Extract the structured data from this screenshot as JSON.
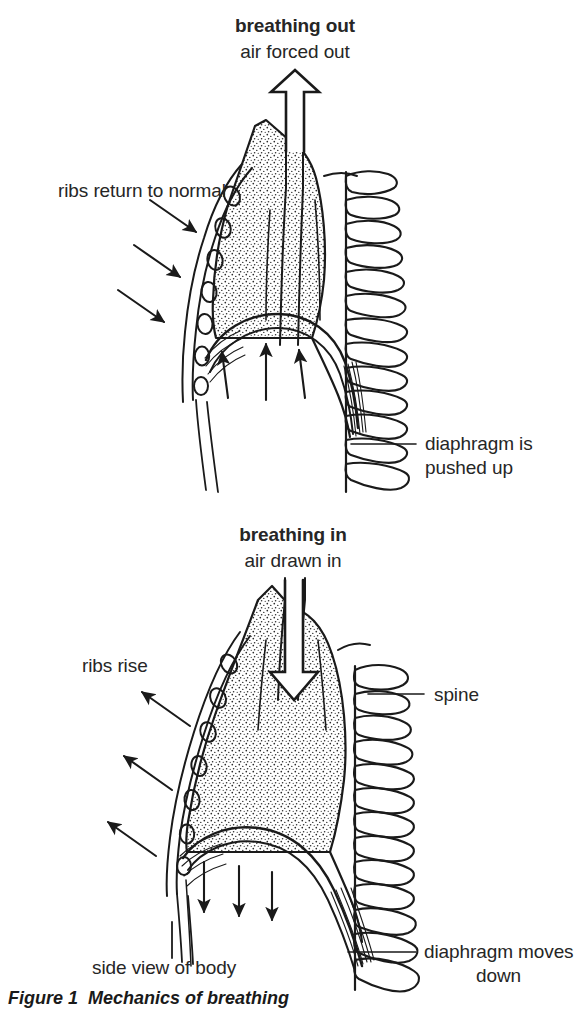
{
  "figure": {
    "caption": "Figure 1  Mechanics of breathing",
    "ink_color": "#1a1a1a",
    "background_color": "#ffffff",
    "stipple_color": "#2b2b2b"
  },
  "panel_top": {
    "title": "breathing out",
    "subtitle": "air forced out",
    "airflow_arrow": "up-outline-arrow",
    "labels": {
      "ribs": "ribs return to normal",
      "diaphragm_line1": "diaphragm is",
      "diaphragm_line2": "pushed up"
    },
    "rib_motion_arrows": {
      "count": 3,
      "direction": "down-right"
    },
    "diaphragm_arrows": {
      "count": 3,
      "direction": "up"
    }
  },
  "panel_bottom": {
    "title": "breathing in",
    "subtitle": "air drawn in",
    "airflow_arrow": "down-outline-arrow",
    "labels": {
      "ribs": "ribs rise",
      "spine": "spine",
      "side_view": "side view of body",
      "diaphragm_line1": "diaphragm moves",
      "diaphragm_line2": "down"
    },
    "rib_motion_arrows": {
      "count": 3,
      "direction": "up-left"
    },
    "diaphragm_arrows": {
      "count": 3,
      "direction": "down"
    }
  }
}
